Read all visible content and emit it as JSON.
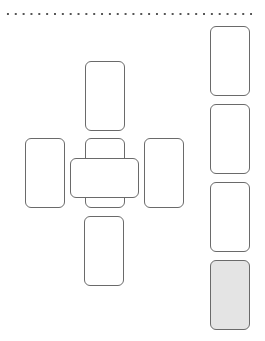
{
  "diagram": {
    "type": "card-spread-layout",
    "divider": {
      "style": "dotted"
    },
    "spread": {
      "cards": [
        {
          "id": "top",
          "x": 85,
          "y": 61,
          "w": 40,
          "h": 70,
          "filled": false
        },
        {
          "id": "left",
          "x": 25,
          "y": 138,
          "w": 40,
          "h": 70,
          "filled": false
        },
        {
          "id": "center",
          "x": 85,
          "y": 138,
          "w": 40,
          "h": 70,
          "filled": false
        },
        {
          "id": "crossing",
          "x": 70,
          "y": 158,
          "w": 69,
          "h": 40,
          "filled": false
        },
        {
          "id": "right",
          "x": 144,
          "y": 138,
          "w": 40,
          "h": 70,
          "filled": false
        },
        {
          "id": "bottom",
          "x": 84,
          "y": 216,
          "w": 40,
          "h": 70,
          "filled": false
        }
      ]
    },
    "staff": {
      "cards": [
        {
          "id": "staff-1",
          "x": 210,
          "y": 26,
          "w": 40,
          "h": 70,
          "filled": false
        },
        {
          "id": "staff-2",
          "x": 210,
          "y": 104,
          "w": 40,
          "h": 70,
          "filled": false
        },
        {
          "id": "staff-3",
          "x": 210,
          "y": 182,
          "w": 40,
          "h": 70,
          "filled": false
        },
        {
          "id": "staff-4",
          "x": 210,
          "y": 260,
          "w": 40,
          "h": 70,
          "filled": true
        }
      ]
    },
    "colors": {
      "border": "#6a6a6a",
      "fill_highlight": "#e4e4e4",
      "background": "#ffffff"
    }
  }
}
